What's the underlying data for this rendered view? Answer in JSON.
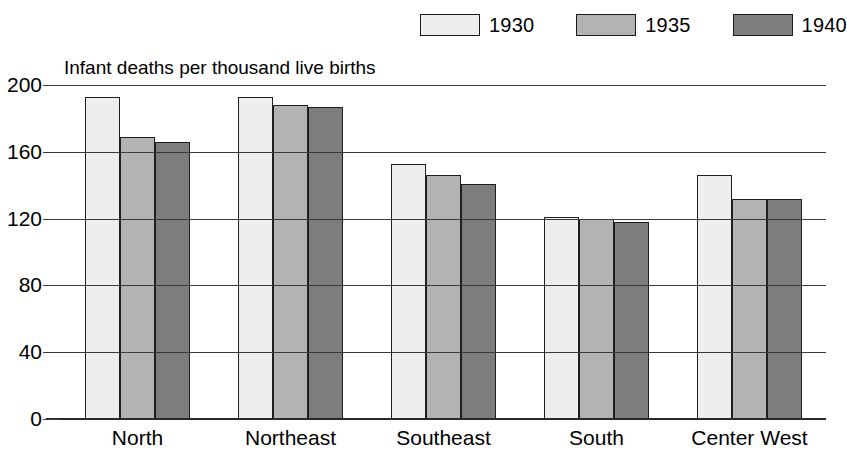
{
  "chart_data": {
    "type": "bar",
    "title": "Infant deaths per thousand live births",
    "xlabel": "",
    "ylabel": "",
    "ylim": [
      0,
      200
    ],
    "yticks": [
      0,
      40,
      80,
      120,
      160,
      200
    ],
    "grid": true,
    "legend_position": "top-right",
    "categories": [
      "North",
      "Northeast",
      "Southeast",
      "South",
      "Center West"
    ],
    "series": [
      {
        "name": "1930",
        "color": "#eeeeee",
        "values": [
          193,
          193,
          153,
          121,
          146
        ]
      },
      {
        "name": "1935",
        "color": "#b3b3b3",
        "values": [
          169,
          188,
          146,
          120,
          132
        ]
      },
      {
        "name": "1940",
        "color": "#7d7d7d",
        "values": [
          166,
          187,
          141,
          118,
          132
        ]
      }
    ]
  },
  "legend": {
    "items": [
      {
        "label": "1930",
        "swatch_color": "#eeeeee"
      },
      {
        "label": "1935",
        "swatch_color": "#b3b3b3"
      },
      {
        "label": "1940",
        "swatch_color": "#7d7d7d"
      }
    ]
  },
  "axis": {
    "y_tick_labels": [
      "200",
      "160",
      "120",
      "80",
      "40",
      "0"
    ],
    "x_tick_labels": [
      "North",
      "Northeast",
      "Southeast",
      "South",
      "Center West"
    ]
  },
  "colors": {
    "axis_line": "#2a2a2a",
    "gridline": "#3a3a3a",
    "bar_border": "#1f1f1f",
    "text": "#000000",
    "background": "#ffffff"
  }
}
